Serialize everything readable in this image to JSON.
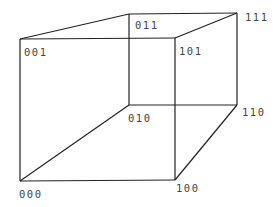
{
  "diagram": {
    "type": "cube",
    "vertices": [
      {
        "id": "000",
        "label": "000",
        "x": 20,
        "y": 181,
        "lx": 19,
        "ly": 198
      },
      {
        "id": "100",
        "label": "100",
        "x": 175,
        "y": 180,
        "lx": 176,
        "ly": 192
      },
      {
        "id": "010",
        "label": "010",
        "x": 129,
        "y": 105,
        "lx": 128,
        "ly": 122
      },
      {
        "id": "110",
        "label": "110",
        "x": 237,
        "y": 105,
        "lx": 242,
        "ly": 116
      },
      {
        "id": "001",
        "label": "001",
        "x": 20,
        "y": 39,
        "lx": 24,
        "ly": 56
      },
      {
        "id": "101",
        "label": "101",
        "x": 175,
        "y": 38,
        "lx": 179,
        "ly": 55
      },
      {
        "id": "011",
        "label": "011",
        "x": 129,
        "y": 14,
        "lx": 135,
        "ly": 29
      },
      {
        "id": "111",
        "label": "111",
        "x": 237,
        "y": 13,
        "lx": 245,
        "ly": 21
      }
    ],
    "edges": [
      [
        "000",
        "100"
      ],
      [
        "000",
        "010"
      ],
      [
        "000",
        "001"
      ],
      [
        "100",
        "110"
      ],
      [
        "100",
        "101"
      ],
      [
        "010",
        "110"
      ],
      [
        "010",
        "011"
      ],
      [
        "110",
        "111"
      ],
      [
        "001",
        "101"
      ],
      [
        "001",
        "011"
      ],
      [
        "101",
        "111"
      ],
      [
        "011",
        "111"
      ]
    ]
  }
}
